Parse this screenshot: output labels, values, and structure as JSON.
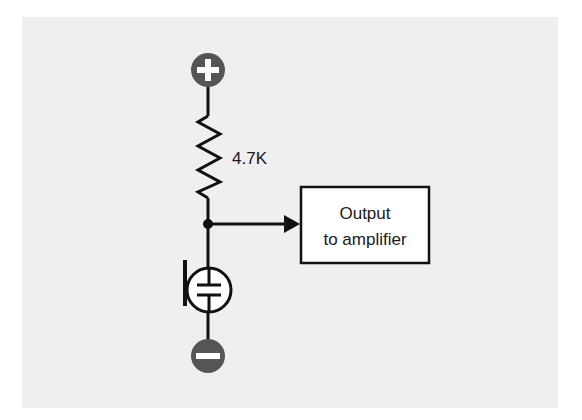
{
  "diagram": {
    "type": "circuit-schematic",
    "colors": {
      "background_panel": "#efefef",
      "page": "#ffffff",
      "wire": "#111111",
      "terminal_fill": "#555555",
      "terminal_symbol": "#ffffff",
      "box_fill": "#ffffff"
    },
    "terminals": {
      "positive": {
        "symbol": "+",
        "name": "positive-supply"
      },
      "negative": {
        "symbol": "−",
        "name": "ground"
      }
    },
    "resistor": {
      "value_label": "4.7K"
    },
    "output_box": {
      "line1": "Output",
      "line2": "to amplifier"
    },
    "microphone": {
      "symbol": "electret-microphone"
    }
  }
}
